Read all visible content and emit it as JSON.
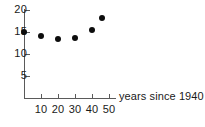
{
  "chart_data": {
    "type": "scatter",
    "title": "",
    "xlabel": "years since 1940",
    "ylabel": "",
    "xlim": [
      -3,
      55
    ],
    "ylim": [
      0,
      21
    ],
    "grid": false,
    "legend": null,
    "x_ticks": [
      10,
      20,
      30,
      40,
      50
    ],
    "x_tick_labels": [
      "10",
      "20",
      "30",
      "40",
      "50"
    ],
    "y_ticks": [
      5,
      10,
      15,
      20
    ],
    "y_tick_labels": [
      "5",
      "10",
      "15",
      "20"
    ],
    "marker": {
      "shape": "circle",
      "color": "#0d0d0d",
      "size_px": 6
    },
    "points": [
      {
        "x": 0,
        "y": 15.0
      },
      {
        "x": 10,
        "y": 14.0
      },
      {
        "x": 20,
        "y": 13.5
      },
      {
        "x": 30,
        "y": 13.6
      },
      {
        "x": 40,
        "y": 15.5
      },
      {
        "x": 46,
        "y": 18.2
      }
    ],
    "axis_color": "#5a5a5a",
    "text_color": "#1a1a1a",
    "background": "#ffffff"
  },
  "geometry": {
    "x_origin_px": 24,
    "y_origin_px": 98,
    "x_px_per_unit": 1.7,
    "y_px_per_unit": 4.4,
    "y_value_at_origin": 0
  }
}
